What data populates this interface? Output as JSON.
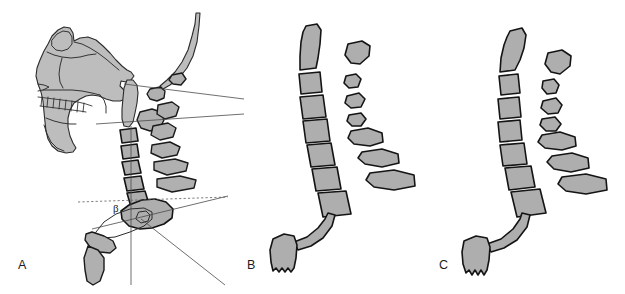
{
  "figure": {
    "type": "anatomical-illustration",
    "background_color": "#ffffff",
    "bone_fill_color": "#aeaeae",
    "bone_outline_color": "#141414",
    "reference_line_color": "#4a4a4a",
    "landmark_dark_color": "#3c3c3c",
    "landmark_light_color": "#a5a5a5"
  },
  "panels": [
    {
      "id": "panel-a",
      "label": "A",
      "description": "Lateral cephalometric tracing showing skull profile, maxilla, mandible, teeth, cervical spine, hyoid bone and reference lines",
      "angle_symbol": "β",
      "has_vertical_reference_line": true,
      "has_dotted_horizontal_reference_line": true,
      "landmark_count": 2
    },
    {
      "id": "panel-b",
      "label": "B",
      "description": "Isolated cervical vertebral column with spinous processes and hyoid bone, straighter alignment",
      "vertebra_count": 7,
      "spinous_process_count": 7,
      "has_hyoid": true
    },
    {
      "id": "panel-c",
      "label": "C",
      "description": "Isolated cervical vertebral column with spinous processes and hyoid bone, increased lordotic curvature",
      "vertebra_count": 7,
      "spinous_process_count": 7,
      "has_hyoid": true
    }
  ]
}
